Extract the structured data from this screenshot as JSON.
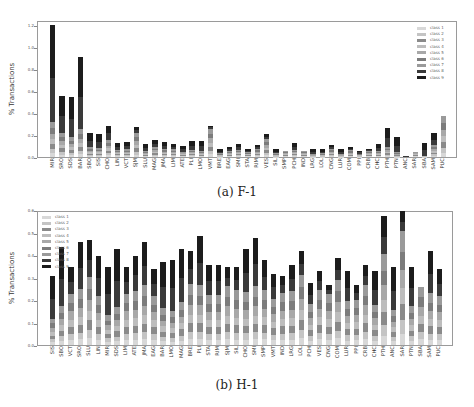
{
  "chart_data": [
    {
      "type": "bar",
      "stacked": true,
      "title": "(a) F-1",
      "caption": "(a) F-1",
      "xlabel": "",
      "ylabel": "% Transactions",
      "ylim": [
        0,
        1.25
      ],
      "yticks": [
        "0.0",
        "0.2",
        "0.4",
        "0.6",
        "0.8",
        "1.0",
        "1.2"
      ],
      "legend_position": "upper right",
      "legend": [
        "class 1",
        "class 2",
        "class 3",
        "class 4",
        "class 5",
        "class 6",
        "class 7",
        "class 8",
        "class 9"
      ],
      "categories": [
        "MIR",
        "SRO",
        "SDS",
        "BAR",
        "SBO",
        "SIS",
        "CHO",
        "LIN",
        "VCT",
        "SJM",
        "SLU",
        "MAG",
        "JMA",
        "LIM",
        "ATE",
        "PLI",
        "LMO",
        "VMT",
        "BRE",
        "EAG",
        "SMI",
        "STA",
        "RIM",
        "VES",
        "SIL",
        "SMP",
        "PCH",
        "IND",
        "LRG",
        "LOL",
        "CNG",
        "LUR",
        "COM",
        "PPI",
        "CRB",
        "CHC",
        "PTH",
        "PTN",
        "ANC",
        "SAR",
        "SBA",
        "SAM",
        "PUC"
      ],
      "totals": [
        1.21,
        0.56,
        0.55,
        0.92,
        0.22,
        0.21,
        0.29,
        0.13,
        0.14,
        0.28,
        0.12,
        0.16,
        0.14,
        0.12,
        0.1,
        0.15,
        0.15,
        0.29,
        0.07,
        0.09,
        0.12,
        0.07,
        0.11,
        0.21,
        0.07,
        0.06,
        0.13,
        0.06,
        0.07,
        0.07,
        0.11,
        0.07,
        0.09,
        0.06,
        0.07,
        0.12,
        0.27,
        0.18,
        0.01,
        0.05,
        0.13,
        0.22,
        0.38
      ],
      "dark_fraction": [
        0.73,
        0.6,
        0.67,
        0.72,
        0.6,
        0.6,
        0.45,
        0.5,
        0.5,
        0.2,
        0.5,
        0.4,
        0.45,
        0.4,
        0.5,
        0.55,
        0.6,
        0.1,
        0.5,
        0.35,
        0.45,
        0.3,
        0.3,
        0.2,
        0.5,
        0.0,
        0.5,
        0.0,
        0.6,
        0.5,
        0.3,
        0.6,
        0.3,
        0.5,
        0.2,
        0.5,
        0.65,
        0.75,
        0.8,
        0.0,
        0.9,
        0.5,
        0.0
      ]
    },
    {
      "type": "bar",
      "stacked": true,
      "title": "(b) H-1",
      "caption": "(b) H-1",
      "xlabel": "",
      "ylabel": "% Transactions",
      "ylim": [
        0,
        0.6
      ],
      "yticks": [
        "0.0",
        "0.1",
        "0.2",
        "0.3",
        "0.4",
        "0.5",
        "0.6"
      ],
      "legend_position": "upper left",
      "legend": [
        "class 1",
        "class 2",
        "class 3",
        "class 4",
        "class 5",
        "class 6",
        "class 7",
        "class 8",
        "class 9"
      ],
      "categories": [
        "SIS",
        "SBO",
        "VCT",
        "SRO",
        "SLU",
        "LIN",
        "MIR",
        "SDS",
        "LIM",
        "ATE",
        "JMA",
        "EAG",
        "BAR",
        "LMO",
        "MAG",
        "BRE",
        "PLI",
        "STA",
        "RIM",
        "SJM",
        "SIL",
        "CHO",
        "SMI",
        "SMP",
        "VMT",
        "IND",
        "LRG",
        "LOL",
        "PCH",
        "VES",
        "CNG",
        "COM",
        "LUR",
        "PPI",
        "CRB",
        "CHC",
        "PTH",
        "ANC",
        "SAR",
        "PTN",
        "SBA",
        "SAM",
        "PUC"
      ],
      "totals": [
        0.31,
        0.44,
        0.35,
        0.46,
        0.47,
        0.4,
        0.35,
        0.43,
        0.35,
        0.4,
        0.46,
        0.34,
        0.37,
        0.38,
        0.43,
        0.42,
        0.49,
        0.36,
        0.36,
        0.35,
        0.35,
        0.43,
        0.48,
        0.38,
        0.32,
        0.31,
        0.36,
        0.42,
        0.28,
        0.33,
        0.27,
        0.39,
        0.33,
        0.27,
        0.36,
        0.33,
        0.58,
        0.35,
        0.6,
        0.35,
        0.26,
        0.42,
        0.34
      ],
      "dark_fraction": [
        0.62,
        0.6,
        0.35,
        0.45,
        0.35,
        0.45,
        0.62,
        0.6,
        0.35,
        0.4,
        0.42,
        0.35,
        0.55,
        0.6,
        0.55,
        0.35,
        0.45,
        0.38,
        0.38,
        0.25,
        0.3,
        0.45,
        0.45,
        0.35,
        0.35,
        0.25,
        0.33,
        0.25,
        0.35,
        0.25,
        0.15,
        0.25,
        0.4,
        0.25,
        0.25,
        0.45,
        0.3,
        0.55,
        0.15,
        0.5,
        0.0,
        0.45,
        0.35
      ]
    }
  ],
  "captions": {
    "top": "(a) F-1",
    "bottom": "(b) H-1"
  },
  "axes": {
    "ylabel": "% Transactions"
  },
  "colors": {
    "class_1": "#d8d8d8",
    "class_2": "#c4c4c4",
    "class_3": "#8a8a8a",
    "class_4": "#bdbdbd",
    "class_5": "#a8a8a8",
    "class_6": "#7c7c7c",
    "class_7": "#9a9a9a",
    "class_8": "#3a3a3a",
    "class_9": "#1c1c1c"
  }
}
